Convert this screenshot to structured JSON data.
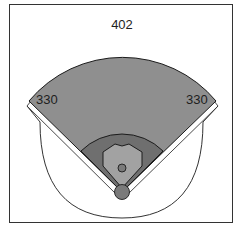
{
  "diagram": {
    "type": "baseball-field",
    "distances": {
      "left_field": "330",
      "center_field": "402",
      "right_field": "330"
    },
    "colors": {
      "outfield": "#8f8f8f",
      "infield_grass": "#6f6f6f",
      "infield_dirt": "#a2a2a2",
      "pitchers_mound": "#7a7a7a",
      "home_area": "#7a7a7a",
      "foul_territory": "#ffffff",
      "outline": "#1c1c1c",
      "frame": "#333333"
    }
  }
}
